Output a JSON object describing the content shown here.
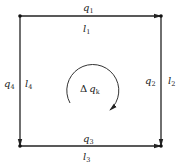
{
  "diagram": {
    "type": "pipe-loop",
    "edges": {
      "top": {
        "flow": "q",
        "flow_sub": "1",
        "length": "l",
        "length_sub": "1"
      },
      "right": {
        "flow": "q",
        "flow_sub": "2",
        "length": "l",
        "length_sub": "2"
      },
      "bottom": {
        "flow": "q",
        "flow_sub": "3",
        "length": "l",
        "length_sub": "3"
      },
      "left": {
        "flow": "q",
        "flow_sub": "4",
        "length": "l",
        "length_sub": "4"
      }
    },
    "loop_correction": {
      "delta": "Δ",
      "symbol": "q",
      "sub": "k",
      "direction": "clockwise"
    },
    "colors": {
      "line": "#222222",
      "node": "#111111"
    }
  }
}
